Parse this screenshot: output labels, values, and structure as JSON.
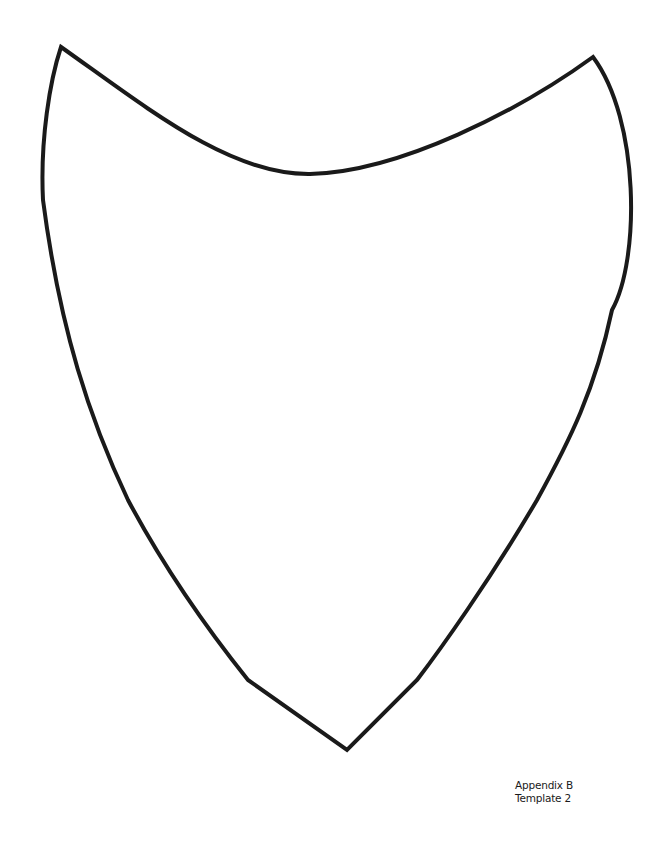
{
  "document": {
    "type": "template",
    "background_color": "#ffffff",
    "stroke_color": "#1a1a1a"
  },
  "shape": {
    "name": "shield-outline",
    "description": "Hand-drawn shield outline with two upper points, a concave top edge and a pointed bottom"
  },
  "caption": {
    "line1": "Appendix B",
    "line2": "Template 2"
  }
}
